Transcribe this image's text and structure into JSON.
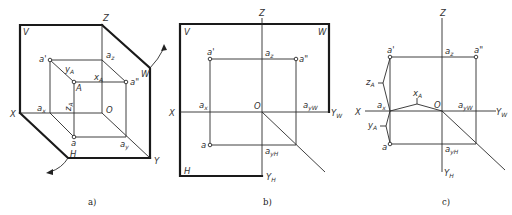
{
  "figure": {
    "panels": [
      {
        "id": "a",
        "caption": "a)",
        "view": "isometric three-plane projection system",
        "labels": {
          "V": "V",
          "H": "H",
          "W": "W",
          "X": "X",
          "Y": "Y",
          "Z": "Z",
          "O": "O",
          "A": "A",
          "a_prime": "a'",
          "a_double_prime": "a\"",
          "a": "a",
          "a_x": "a",
          "a_x_sub": "x",
          "a_z": "a",
          "a_z_sub": "z",
          "a_y": "a",
          "a_y_sub": "y",
          "x_A": "x",
          "x_A_sub": "A",
          "y_A": "y",
          "y_A_sub": "A",
          "z_A": "z",
          "z_A_sub": "A"
        }
      },
      {
        "id": "b",
        "caption": "b)",
        "view": "unfolded projection planes",
        "labels": {
          "V": "V",
          "H": "H",
          "W": "W",
          "X": "X",
          "Z": "Z",
          "O": "O",
          "Y_W": "Y",
          "Y_W_sub": "W",
          "Y_H": "Y",
          "Y_H_sub": "H",
          "a_prime": "a'",
          "a_double_prime": "a\"",
          "a": "a",
          "a_x": "a",
          "a_x_sub": "x",
          "a_z": "a",
          "a_z_sub": "z",
          "a_yW": "a",
          "a_yW_sub": "yW",
          "a_yH": "a",
          "a_yH_sub": "yH"
        }
      },
      {
        "id": "c",
        "caption": "c)",
        "view": "three-view projection of point A",
        "labels": {
          "X": "X",
          "Z": "Z",
          "O": "O",
          "Y_W": "Y",
          "Y_W_sub": "W",
          "Y_H": "Y",
          "Y_H_sub": "H",
          "a_prime": "a'",
          "a_double_prime": "a\"",
          "a": "a",
          "a_x": "a",
          "a_x_sub": "x",
          "a_z": "a",
          "a_z_sub": "z",
          "a_yW": "a",
          "a_yW_sub": "yW",
          "a_yH": "a",
          "a_yH_sub": "yH",
          "x_A": "x",
          "x_A_sub": "A",
          "y_A": "y",
          "y_A_sub": "A",
          "z_A": "z",
          "z_A_sub": "A"
        }
      }
    ],
    "colors": {
      "line": "#1a1a1a",
      "text": "#333333",
      "background": "#ffffff"
    }
  }
}
